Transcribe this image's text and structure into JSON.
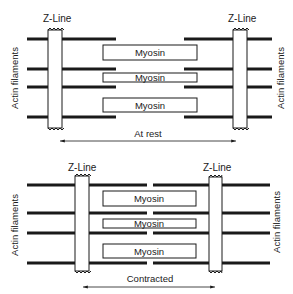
{
  "labels": {
    "z_line": "Z-Line",
    "actin": "Actin filaments",
    "myosin": "Myosin",
    "rest": "At rest",
    "contracted": "Contracted"
  },
  "colors": {
    "ink": "#1a1a1a",
    "background": "#ffffff"
  },
  "panels": [
    {
      "name": "at-rest",
      "state_label": "At rest",
      "z_lines": [
        {
          "x": 48,
          "width": 14,
          "y1": 30,
          "y2": 128
        },
        {
          "x": 233,
          "width": 14,
          "y1": 30,
          "y2": 128
        }
      ],
      "actin_rows_y": [
        39,
        69,
        87,
        117
      ],
      "actin_left": {
        "x1": 27,
        "x2": 116
      },
      "actin_right": {
        "x1": 184,
        "x2": 272
      },
      "myosin": [
        {
          "x": 103,
          "y": 45,
          "w": 94,
          "h": 15
        },
        {
          "x": 103,
          "y": 73,
          "w": 94,
          "h": 9
        },
        {
          "x": 103,
          "y": 98,
          "w": 94,
          "h": 14
        }
      ],
      "arrow": {
        "x1": 60,
        "x2": 236,
        "y": 141
      }
    },
    {
      "name": "contracted",
      "state_label": "Contracted",
      "z_lines": [
        {
          "x": 75,
          "width": 14,
          "y1": 176,
          "y2": 271
        },
        {
          "x": 209,
          "width": 13,
          "y1": 177,
          "y2": 271
        }
      ],
      "actin_rows_y": [
        185,
        213,
        233,
        263
      ],
      "actin_left": {
        "x1": 27,
        "x2": 147
      },
      "actin_right": {
        "x1": 153,
        "x2": 270
      },
      "myosin": [
        {
          "x": 103,
          "y": 191,
          "w": 93,
          "h": 15
        },
        {
          "x": 103,
          "y": 219,
          "w": 93,
          "h": 9
        },
        {
          "x": 103,
          "y": 244,
          "w": 93,
          "h": 14
        }
      ],
      "arrow": {
        "x1": 83,
        "x2": 215,
        "y": 287
      }
    }
  ]
}
